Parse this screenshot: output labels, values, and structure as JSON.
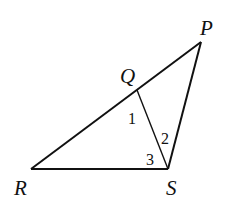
{
  "diagram": {
    "type": "geometry-triangle",
    "stroke_color": "#111111",
    "background": "#ffffff",
    "vertices": {
      "P": {
        "label": "P",
        "x": 201,
        "y": 42
      },
      "Q": {
        "label": "Q",
        "x": 137,
        "y": 90
      },
      "R": {
        "label": "R",
        "x": 31,
        "y": 169
      },
      "S": {
        "label": "S",
        "x": 168,
        "y": 169
      }
    },
    "segments": [
      {
        "from": "R",
        "to": "P"
      },
      {
        "from": "R",
        "to": "S"
      },
      {
        "from": "S",
        "to": "P"
      },
      {
        "from": "Q",
        "to": "S"
      }
    ],
    "angle_labels": [
      {
        "label": "1",
        "description": "angle RQS at Q"
      },
      {
        "label": "2",
        "description": "angle QSP at S"
      },
      {
        "label": "3",
        "description": "angle RSQ at S"
      }
    ]
  }
}
